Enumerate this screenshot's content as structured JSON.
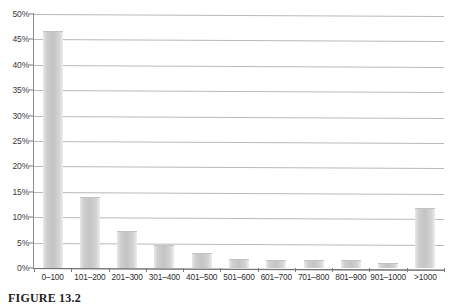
{
  "figure": {
    "caption": "FIGURE 13.2"
  },
  "chart_data": {
    "type": "bar",
    "title": "",
    "xlabel": "",
    "ylabel": "",
    "ylim": [
      0,
      50
    ],
    "grid": true,
    "legend": "none",
    "y_tick_labels": [
      "0%",
      "5%",
      "10%",
      "15%",
      "20%",
      "25%",
      "30%",
      "35%",
      "40%",
      "45%",
      "50%"
    ],
    "y_tick_values": [
      0,
      5,
      10,
      15,
      20,
      25,
      30,
      35,
      40,
      45,
      50
    ],
    "categories": [
      "0–100",
      "101–200",
      "201–300",
      "301–400",
      "401–500",
      "501–600",
      "601–700",
      "701–800",
      "801–900",
      "901–1000",
      ">1000"
    ],
    "values": [
      46.5,
      13.7,
      7.0,
      4.3,
      2.7,
      1.6,
      1.3,
      1.3,
      1.3,
      0.8,
      11.7
    ],
    "value_labels": [
      "46.5%",
      "13.7%",
      "7.0%",
      "4.3%",
      "2.7%",
      "1.6%",
      "1.3%",
      "1.3%",
      "1.3%",
      "0.8%",
      "11.7%"
    ],
    "bar_color": "#c8c8c8",
    "gridline_color": "#b9b9b9",
    "axis_color": "#7d7d7d"
  }
}
